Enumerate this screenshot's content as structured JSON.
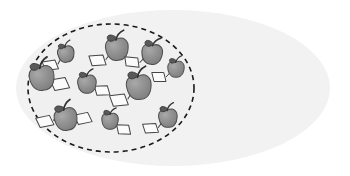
{
  "diagram": {
    "type": "set-venn-subset",
    "title": "",
    "canvas": {
      "width": 350,
      "height": 176,
      "background": "#ffffff"
    },
    "universe_set": {
      "name": "universe-ellipse",
      "label": "",
      "shape": "ellipse",
      "cx": 173,
      "cy": 88,
      "rx": 157,
      "ry": 78,
      "fill": "#f2f2f2",
      "stroke": "none",
      "stroke_width": 0
    },
    "subset": {
      "name": "subset-ellipse",
      "label": "",
      "shape": "ellipse",
      "cx": 111,
      "cy": 88,
      "rx": 83,
      "ry": 64,
      "fill": "#f0f0f0",
      "stroke": "#1a1a1a",
      "stroke_width": 1.6,
      "stroke_style": "dashed",
      "dash_pattern": "5 4"
    },
    "item_style": {
      "kind": "apple-with-tag",
      "body_fill": "#8c8c8c",
      "body_stroke": "#4d4d4d",
      "highlight_fill": "#a6a6a6",
      "stem_stroke": "#333333",
      "leaf_fill": "#595959",
      "leaf_stroke": "#333333",
      "tag_fill": "#fbfbfb",
      "tag_stroke": "#444444",
      "string_stroke": "#444444"
    },
    "item_count": 11,
    "items": [
      {
        "id": 1,
        "name": "apple-1",
        "x": 66,
        "y": 54,
        "r": 8,
        "rot": -8,
        "tags": [
          {
            "side": "left",
            "dx": -16,
            "dy": 9,
            "w": 13,
            "h": 9,
            "skew": -14
          }
        ]
      },
      {
        "id": 2,
        "name": "apple-2",
        "x": 117,
        "y": 49,
        "r": 11,
        "rot": -4,
        "tags": [
          {
            "side": "left",
            "dx": -19,
            "dy": 10,
            "w": 14,
            "h": 10,
            "skew": -14
          }
        ]
      },
      {
        "id": 3,
        "name": "apple-3",
        "x": 152,
        "y": 54,
        "r": 10,
        "rot": 6,
        "tags": [
          {
            "side": "left",
            "dx": -18,
            "dy": 10,
            "w": 13,
            "h": 9,
            "skew": -14
          }
        ]
      },
      {
        "id": 4,
        "name": "apple-4",
        "x": 176,
        "y": 69,
        "r": 8,
        "rot": 0,
        "tags": [
          {
            "side": "left",
            "dx": -16,
            "dy": 8,
            "w": 12,
            "h": 9,
            "skew": -14
          }
        ]
      },
      {
        "id": 5,
        "name": "apple-5",
        "x": 42,
        "y": 78,
        "r": 12,
        "rot": -10,
        "tags": [
          {
            "side": "right",
            "dx": 18,
            "dy": 9,
            "w": 15,
            "h": 11,
            "skew": -14
          }
        ]
      },
      {
        "id": 6,
        "name": "apple-6",
        "x": 87,
        "y": 84,
        "r": 9,
        "rot": -2,
        "tags": [
          {
            "side": "right",
            "dx": 16,
            "dy": 7,
            "w": 13,
            "h": 9,
            "skew": -14
          }
        ]
      },
      {
        "id": 7,
        "name": "apple-7",
        "x": 139,
        "y": 87,
        "r": 12,
        "rot": -6,
        "tags": [
          {
            "side": "left",
            "dx": -20,
            "dy": 11,
            "w": 15,
            "h": 11,
            "skew": -14
          }
        ]
      },
      {
        "id": 8,
        "name": "apple-8",
        "x": 66,
        "y": 119,
        "r": 11,
        "rot": -12,
        "tags": [
          {
            "side": "left",
            "dx": -20,
            "dy": -2,
            "w": 14,
            "h": 10,
            "skew": -14
          },
          {
            "side": "right",
            "dx": 18,
            "dy": 3,
            "w": 14,
            "h": 10,
            "skew": -14
          }
        ]
      },
      {
        "id": 9,
        "name": "apple-9",
        "x": 110,
        "y": 121,
        "r": 8,
        "rot": 2,
        "tags": [
          {
            "side": "right",
            "dx": 15,
            "dy": 8,
            "w": 12,
            "h": 9,
            "skew": -14
          }
        ]
      },
      {
        "id": 10,
        "name": "apple-10",
        "x": 168,
        "y": 118,
        "r": 9,
        "rot": -4,
        "tags": [
          {
            "side": "left",
            "dx": -17,
            "dy": 9,
            "w": 13,
            "h": 9,
            "skew": -14
          }
        ]
      },
      {
        "id": 11,
        "name": "apple-11",
        "x": 192,
        "y": 82,
        "r": 0,
        "rot": 0,
        "hidden": true,
        "tags": []
      }
    ]
  }
}
